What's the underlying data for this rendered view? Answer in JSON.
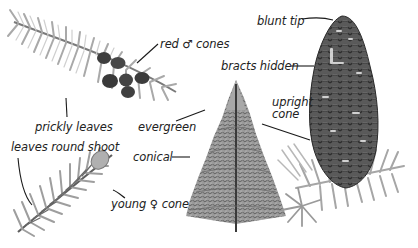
{
  "diagram": {
    "colors": {
      "background": "#ffffff",
      "text": "#222222",
      "leader_line": "#1a1a1a",
      "foliage_light": "#b8b8b8",
      "foliage_mid": "#8c8c8c",
      "foliage_dark": "#5a5a5a",
      "cone_dark": "#3c3c3c",
      "cone_mid": "#6e6e6e"
    },
    "labels": {
      "red_male_cones": "red ♂ cones",
      "prickly_leaves": "prickly leaves",
      "leaves_round_shoot": "leaves round shoot",
      "young_female_cone": "young ♀ cone",
      "evergreen": "evergreen",
      "conical": "conical",
      "blunt_tip": "blunt tip",
      "bracts_hidden": "bracts hidden",
      "upright_cone_line1": "upright",
      "upright_cone_line2": "cone"
    },
    "illustrations": [
      {
        "name": "shoot-with-male-cones",
        "position": "top-left"
      },
      {
        "name": "shoot-with-young-female-cone",
        "position": "bottom-left"
      },
      {
        "name": "whole-tree",
        "position": "center"
      },
      {
        "name": "upright-mature-cone-on-shoot",
        "position": "right"
      }
    ]
  }
}
